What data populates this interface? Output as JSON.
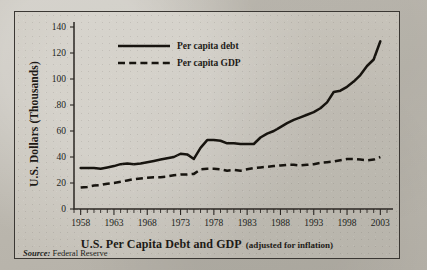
{
  "figure": {
    "source_label": "Source:",
    "source_value": "Federal Reserve",
    "title_main": "U.S. Per Capita Debt and GDP",
    "title_sub": "(adjusted for inflation)",
    "y_axis_title": "U.S. Dollars (Thousands)"
  },
  "chart_data": {
    "type": "line",
    "title": "U.S. Per Capita Debt and GDP (adjusted for inflation)",
    "subtitle": "(adjusted for inflation)",
    "source": "Source: Federal Reserve",
    "xlabel": "U.S. Per Capita Debt and GDP (adjusted for inflation)",
    "ylabel": "U.S. Dollars (Thousands)",
    "xlim": [
      1957,
      2004
    ],
    "ylim": [
      0,
      140
    ],
    "yticks": [
      0,
      20,
      40,
      60,
      80,
      100,
      120,
      140
    ],
    "ytick_labels": [
      "0",
      "20",
      "40",
      "60",
      ".80",
      "100",
      "120",
      "140"
    ],
    "xticks": [
      1958,
      1963,
      1968,
      1973,
      1978,
      1983,
      1988,
      1993,
      1998,
      2003
    ],
    "xtick_labels": [
      "1958",
      "1963",
      "1968",
      "1973",
      "1978",
      "1983",
      "1988",
      "1993",
      "1998",
      "2003"
    ],
    "x_minor_tick_step": 1,
    "grid": false,
    "legend_position": "top-left",
    "x": [
      1958,
      1959,
      1960,
      1961,
      1962,
      1963,
      1964,
      1965,
      1966,
      1967,
      1968,
      1969,
      1970,
      1971,
      1972,
      1973,
      1974,
      1975,
      1976,
      1977,
      1978,
      1979,
      1980,
      1981,
      1982,
      1983,
      1984,
      1985,
      1986,
      1987,
      1988,
      1989,
      1990,
      1991,
      1992,
      1993,
      1994,
      1995,
      1996,
      1997,
      1998,
      1999,
      2000,
      2001,
      2002,
      2003
    ],
    "series": [
      {
        "name": "Per capita debt",
        "style": "solid",
        "color": "#17140f",
        "values": [
          31.5,
          31.5,
          31.5,
          31.0,
          32.0,
          33.0,
          34.5,
          35.0,
          34.5,
          35.0,
          36.0,
          37.0,
          38.0,
          39.0,
          40.0,
          42.5,
          42.0,
          38.5,
          47.0,
          53.0,
          53.0,
          52.5,
          50.5,
          50.5,
          50.0,
          50.0,
          50.0,
          55.0,
          58.0,
          60.0,
          63.0,
          66.0,
          68.5,
          70.5,
          72.5,
          74.5,
          77.5,
          82.0,
          90.0,
          91.0,
          94.0,
          98.0,
          103.0,
          110.0,
          115.0,
          129.0
        ]
      },
      {
        "name": "Per capita GDP",
        "style": "dashed",
        "color": "#17140f",
        "values": [
          16.5,
          17.0,
          18.0,
          18.5,
          19.5,
          20.0,
          21.0,
          22.0,
          23.0,
          23.5,
          24.0,
          24.5,
          24.5,
          25.0,
          26.0,
          26.5,
          26.5,
          27.0,
          30.5,
          31.0,
          31.0,
          30.5,
          29.5,
          30.0,
          29.5,
          30.5,
          31.5,
          32.0,
          32.5,
          33.0,
          33.5,
          34.0,
          34.0,
          33.5,
          34.0,
          34.5,
          35.5,
          36.0,
          36.5,
          37.5,
          38.5,
          38.5,
          38.0,
          37.5,
          38.0,
          40.0
        ]
      }
    ],
    "legend": [
      {
        "label": "Per capita debt",
        "style": "solid"
      },
      {
        "label": "Per capita GDP",
        "style": "dashed"
      }
    ]
  }
}
